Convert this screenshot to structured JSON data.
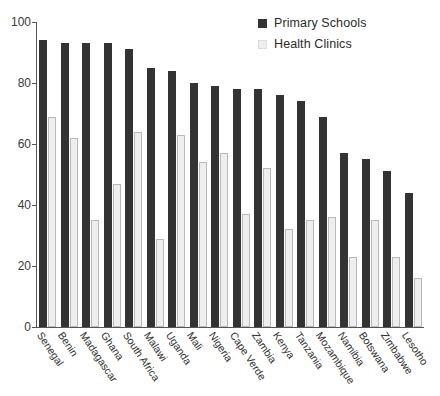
{
  "chart_data": {
    "type": "bar",
    "title": "",
    "subtitle": "",
    "xlabel": "",
    "ylabel": "",
    "ylim": [
      0,
      100
    ],
    "yticks": [
      0,
      20,
      40,
      60,
      80,
      100
    ],
    "grid": false,
    "legend_position": "top-right",
    "categories": [
      "Senegal",
      "Benin",
      "Madagascar",
      "Ghana",
      "South Africa",
      "Malawi",
      "Uganda",
      "Mali",
      "Nigeria",
      "Cape Verde",
      "Zambia",
      "Kenya",
      "Tanzania",
      "Mozambique",
      "Namibia",
      "Botswana",
      "Zimbabwe",
      "Lesotho"
    ],
    "series": [
      {
        "name": "Primary Schools",
        "color": "#333333",
        "values": [
          94,
          93,
          93,
          93,
          91,
          85,
          84,
          80,
          79,
          78,
          78,
          76,
          74,
          69,
          57,
          55,
          51,
          44
        ]
      },
      {
        "name": "Health Clinics",
        "color": "#eeeeee",
        "values": [
          69,
          62,
          35,
          47,
          64,
          29,
          63,
          54,
          57,
          37,
          52,
          32,
          35,
          36,
          23,
          35,
          23,
          16
        ]
      }
    ]
  },
  "legend": {
    "items": [
      {
        "label": "Primary Schools",
        "color": "#333333"
      },
      {
        "label": "Health Clinics",
        "color": "#eeeeee"
      }
    ]
  },
  "axis": {
    "y_tick_labels": [
      "100",
      "80",
      "60",
      "40",
      "20",
      "0"
    ]
  }
}
